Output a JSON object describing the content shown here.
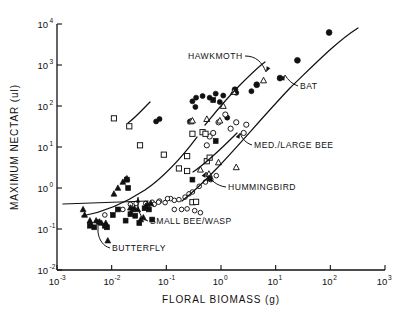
{
  "chart_data": {
    "type": "scatter",
    "title": "",
    "xlabel": "FLORAL  BIOMASS  (g)",
    "ylabel": "MAXIMUM  NECTAR  (ul)",
    "xscale": "log",
    "yscale": "log",
    "xlim": [
      0.001,
      1000
    ],
    "ylim": [
      0.01,
      10000
    ],
    "grid": false,
    "legend_position": "inline-annotations",
    "xticks": [
      {
        "value": 0.001,
        "mantissa": "10",
        "exponent": "-3"
      },
      {
        "value": 0.01,
        "mantissa": "10",
        "exponent": "-2"
      },
      {
        "value": 0.1,
        "mantissa": "10",
        "exponent": "-1"
      },
      {
        "value": 1,
        "mantissa": "10",
        "exponent": "0"
      },
      {
        "value": 10,
        "mantissa": "10",
        "exponent": "1"
      },
      {
        "value": 100,
        "mantissa": "10",
        "exponent": "2"
      },
      {
        "value": 1000,
        "mantissa": "10",
        "exponent": "3"
      }
    ],
    "yticks": [
      {
        "value": 0.01,
        "mantissa": "10",
        "exponent": "-2"
      },
      {
        "value": 0.1,
        "mantissa": "10",
        "exponent": "-1"
      },
      {
        "value": 1,
        "mantissa": "10",
        "exponent": "0"
      },
      {
        "value": 10,
        "mantissa": "10",
        "exponent": "1"
      },
      {
        "value": 100,
        "mantissa": "10",
        "exponent": "2"
      },
      {
        "value": 1000,
        "mantissa": "10",
        "exponent": "3"
      },
      {
        "value": 10000,
        "mantissa": "10",
        "exponent": "4"
      }
    ],
    "annotations": [
      {
        "name": "hawkmoth",
        "label": "HAWKMOTH",
        "text_x": 188,
        "text_y": 59,
        "anchor": "start",
        "leader": "M 245 56 C 256 56 262 62 266 72"
      },
      {
        "name": "bat",
        "label": "BAT",
        "text_x": 300,
        "text_y": 89,
        "anchor": "start",
        "leader": "M 298 86 C 292 84 288 80 285 75"
      },
      {
        "name": "med-large-bee",
        "label": "MED./LARGE  BEE",
        "text_x": 254,
        "text_y": 148,
        "anchor": "start",
        "leader": "M 252 145 C 246 143 242 139 240 133"
      },
      {
        "name": "hummingbird",
        "label": "HUMMINGBIRD",
        "text_x": 228,
        "text_y": 190,
        "anchor": "start",
        "leader": "M 226 187 C 217 186 210 180 206 172"
      },
      {
        "name": "small-bee-wasp",
        "label": "SMALL  BEE/WASP",
        "text_x": 150,
        "text_y": 224,
        "anchor": "start",
        "leader": "M 148 221 C 142 219 139 214 138 206 L 138 197"
      },
      {
        "name": "butterfly",
        "label": "BUTTERFLY",
        "text_x": 112,
        "text_y": 251,
        "anchor": "start",
        "leader": "M 110 248 C 103 246 99 240 98 232 L 98 219"
      }
    ],
    "series": [
      {
        "name": "hawkmoth",
        "label": "HAWKMOTH",
        "marker": "filled-circle",
        "trend": "M 205 125 C 214 114 226 99 240 85 C 251 74 258 67 265 62",
        "points": [
          [
            0.27,
            42
          ],
          [
            0.3,
            130
          ],
          [
            0.34,
            95
          ],
          [
            0.35,
            160
          ],
          [
            0.46,
            175
          ],
          [
            0.62,
            160
          ],
          [
            0.8,
            200
          ],
          [
            0.95,
            125
          ],
          [
            1.1,
            180
          ],
          [
            1.3,
            52
          ],
          [
            1.9,
            210
          ],
          [
            3.6,
            230
          ],
          [
            0.065,
            42
          ],
          [
            0.075,
            48
          ]
        ]
      },
      {
        "name": "bat",
        "label": "BAT",
        "marker": "filled-circle-large",
        "trend": "M 182 201 C 214 176 252 128 290 88 C 315 64 336 42 358 28",
        "points": [
          [
            4.5,
            330
          ],
          [
            12,
            480
          ],
          [
            25,
            1300
          ],
          [
            95,
            6200
          ],
          [
            1.8,
            250
          ]
        ]
      },
      {
        "name": "med-large-bee",
        "label": "MED./LARGE  BEE",
        "marker": "open-circle",
        "trend": "M 193 172 C 208 162 222 148 237 133",
        "points": [
          [
            0.9,
            40
          ],
          [
            1.2,
            62
          ],
          [
            1.5,
            28
          ],
          [
            1.9,
            40
          ],
          [
            2.6,
            22
          ],
          [
            2.9,
            35
          ],
          [
            0.62,
            18
          ],
          [
            0.72,
            22
          ],
          [
            0.55,
            11
          ]
        ]
      },
      {
        "name": "hummingbird",
        "label": "HUMMINGBIRD",
        "marker": "open-square",
        "trend": "M 128 123 C 136 117 142 110 150 102",
        "points": [
          [
            0.011,
            50
          ],
          [
            0.021,
            32
          ],
          [
            0.033,
            11
          ],
          [
            0.09,
            6.5
          ],
          [
            0.24,
            6.0
          ],
          [
            0.3,
            21
          ],
          [
            0.46,
            23
          ],
          [
            0.52,
            21
          ],
          [
            0.17,
            3.0
          ],
          [
            0.24,
            2.6
          ],
          [
            0.55,
            4.5
          ],
          [
            0.62,
            5.5
          ],
          [
            0.3,
            0.45
          ],
          [
            0.35,
            0.46
          ]
        ]
      },
      {
        "name": "small-bee-wasp",
        "label": "SMALL  BEE/WASP",
        "marker": "open-circle-small",
        "trend": "M 82 216 C 105 212 125 203 145 190 C 165 176 182 157 197 137",
        "points": [
          [
            0.0075,
            0.22
          ],
          [
            0.016,
            0.3
          ],
          [
            0.022,
            0.4
          ],
          [
            0.028,
            0.42
          ],
          [
            0.042,
            0.42
          ],
          [
            0.055,
            0.45
          ],
          [
            0.06,
            0.4
          ],
          [
            0.075,
            0.48
          ],
          [
            0.095,
            0.44
          ],
          [
            0.12,
            0.55
          ],
          [
            0.14,
            0.5
          ],
          [
            0.17,
            0.52
          ],
          [
            0.22,
            0.6
          ],
          [
            0.26,
            0.72
          ],
          [
            0.3,
            0.8
          ],
          [
            0.4,
            1.1
          ],
          [
            0.52,
            1.4
          ],
          [
            0.65,
            1.6
          ],
          [
            0.82,
            2.0
          ],
          [
            0.14,
            0.3
          ],
          [
            0.19,
            0.3
          ],
          [
            0.24,
            0.31
          ],
          [
            0.33,
            0.28
          ],
          [
            0.42,
            0.25
          ],
          [
            0.072,
            0.45
          ],
          [
            0.105,
            0.55
          ]
        ]
      },
      {
        "name": "butterfly",
        "label": "BUTTERFLY",
        "marker": "filled-triangle",
        "trend": "M 63 204 L 148 201",
        "points": [
          [
            0.003,
            0.3
          ],
          [
            0.0032,
            0.22
          ],
          [
            0.004,
            0.16
          ],
          [
            0.0042,
            0.13
          ],
          [
            0.0052,
            0.16
          ],
          [
            0.006,
            0.15
          ],
          [
            0.0065,
            0.14
          ],
          [
            0.0078,
            0.14
          ],
          [
            0.0085,
            0.052
          ],
          [
            0.011,
            0.72
          ],
          [
            0.016,
            1.4
          ],
          [
            0.018,
            1.6
          ],
          [
            0.019,
            1.7
          ],
          [
            0.022,
            0.33
          ],
          [
            0.024,
            0.3
          ],
          [
            0.026,
            0.32
          ],
          [
            0.03,
            0.3
          ],
          [
            0.034,
            0.17
          ],
          [
            0.038,
            0.19
          ],
          [
            0.042,
            0.36
          ],
          [
            0.045,
            0.4
          ],
          [
            0.052,
            0.42
          ],
          [
            0.013,
            1.0
          ]
        ]
      },
      {
        "name": "other-filled-square",
        "label": "",
        "marker": "filled-square",
        "trend": "",
        "points": [
          [
            0.004,
            0.12
          ],
          [
            0.0048,
            0.11
          ],
          [
            0.0075,
            0.12
          ],
          [
            0.0082,
            0.11
          ],
          [
            0.0105,
            0.22
          ],
          [
            0.013,
            0.3
          ],
          [
            0.018,
            0.16
          ],
          [
            0.02,
            1.0
          ],
          [
            0.022,
            0.23
          ],
          [
            0.027,
            0.21
          ],
          [
            0.032,
            0.14
          ],
          [
            0.04,
            0.32
          ],
          [
            0.048,
            0.3
          ],
          [
            0.055,
            0.17
          ],
          [
            0.019,
            1.6
          ],
          [
            0.3,
            1.6
          ],
          [
            0.62,
            1.7
          ],
          [
            0.8,
            14
          ],
          [
            0.72,
            140
          ]
        ]
      },
      {
        "name": "other-open-triangle",
        "label": "",
        "marker": "open-triangle",
        "trend": "",
        "points": [
          [
            0.28,
            42
          ],
          [
            0.55,
            48
          ],
          [
            0.95,
            44
          ],
          [
            1.7,
            220
          ],
          [
            0.9,
            4.2
          ],
          [
            1.9,
            3.2
          ],
          [
            0.42,
            2.8
          ],
          [
            0.6,
            2.2
          ],
          [
            6.0,
            420
          ],
          [
            1.1,
            100
          ],
          [
            0.3,
            44
          ]
        ]
      }
    ]
  }
}
